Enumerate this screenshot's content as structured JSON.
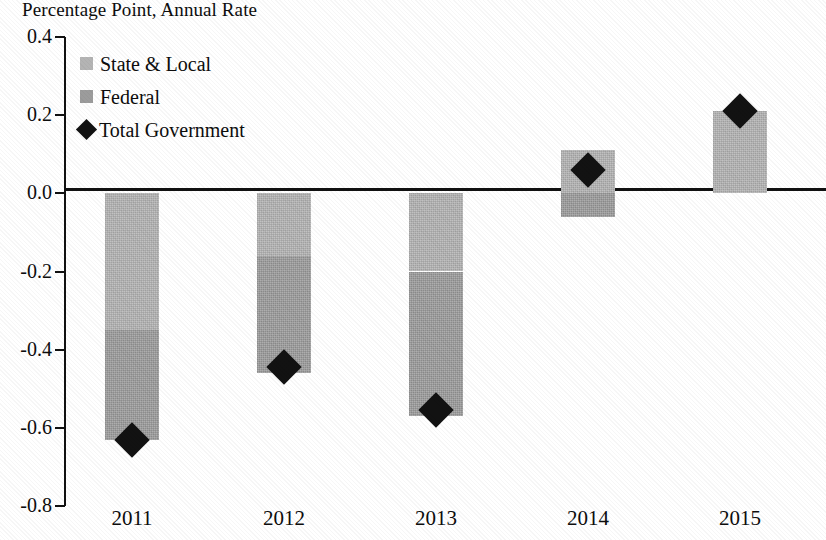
{
  "chart_data": {
    "type": "bar",
    "title": "Percentage Point, Annual Rate",
    "subtitle": "",
    "xlabel": "",
    "ylabel": "Percentage Point, Annual Rate",
    "categories": [
      "2011",
      "2012",
      "2013",
      "2014",
      "2015"
    ],
    "ylim": [
      -0.8,
      0.4
    ],
    "yticks": [
      0.4,
      0.2,
      0.0,
      -0.2,
      -0.4,
      -0.6,
      -0.8
    ],
    "ytick_labels": [
      "0.4",
      "0.2",
      "0.0",
      "-0.2",
      "-0.4",
      "-0.6",
      "-0.8"
    ],
    "grid": false,
    "stacked": true,
    "zero_line": 0.0,
    "legend_position": "upper-left-inside",
    "series": [
      {
        "name": "State & Local",
        "type": "bar",
        "color": "#b4b4b4",
        "values": [
          -0.35,
          -0.16,
          -0.2,
          0.11,
          0.21
        ]
      },
      {
        "name": "Federal",
        "type": "bar",
        "color": "#9c9c9c",
        "values": [
          -0.28,
          -0.3,
          -0.37,
          -0.06,
          0.0
        ]
      },
      {
        "name": "Total Government",
        "type": "marker",
        "marker": "diamond",
        "color": "#121212",
        "values": [
          -0.63,
          -0.445,
          -0.555,
          0.06,
          0.21
        ]
      }
    ]
  },
  "legend": {
    "items": [
      {
        "label": "State & Local",
        "swatch": "square",
        "color": "#b4b4b4"
      },
      {
        "label": "Federal",
        "swatch": "square",
        "color": "#9c9c9c"
      },
      {
        "label": "Total Government",
        "swatch": "diamond",
        "color": "#121212"
      }
    ]
  },
  "axes": {
    "y": {
      "ticks": [
        {
          "label": "0.4",
          "value": 0.4
        },
        {
          "label": "0.2",
          "value": 0.2
        },
        {
          "label": "0.0",
          "value": 0.0
        },
        {
          "label": "-0.2",
          "value": -0.2
        },
        {
          "label": "-0.4",
          "value": -0.4
        },
        {
          "label": "-0.6",
          "value": -0.6
        },
        {
          "label": "-0.8",
          "value": -0.8
        }
      ]
    },
    "x": {
      "ticks": [
        {
          "label": "2011"
        },
        {
          "label": "2012"
        },
        {
          "label": "2013"
        },
        {
          "label": "2014"
        },
        {
          "label": "2015"
        }
      ]
    }
  }
}
